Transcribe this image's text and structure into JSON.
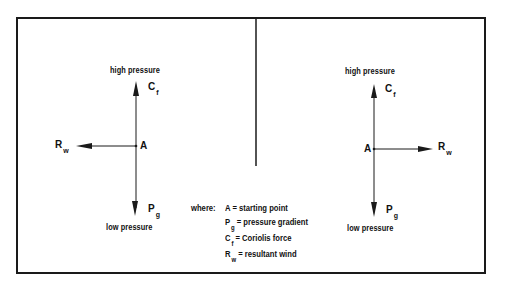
{
  "diagram": {
    "type": "force-vector-diagram",
    "left_panel": {
      "top_label": "high pressure",
      "bottom_label": "low pressure",
      "point_label": "A",
      "up_vector": {
        "symbol": "C",
        "subscript": "f"
      },
      "down_vector": {
        "symbol": "P",
        "subscript": "g"
      },
      "horizontal_vector": {
        "symbol": "R",
        "subscript": "w",
        "direction": "left"
      }
    },
    "right_panel": {
      "top_label": "high pressure",
      "bottom_label": "low pressure",
      "point_label": "A",
      "up_vector": {
        "symbol": "C",
        "subscript": "f"
      },
      "down_vector": {
        "symbol": "P",
        "subscript": "g"
      },
      "horizontal_vector": {
        "symbol": "R",
        "subscript": "w",
        "direction": "right"
      }
    },
    "legend": {
      "intro": "where:",
      "items": [
        {
          "symbol": "A",
          "subscript": "",
          "definition": "= starting point"
        },
        {
          "symbol": "P",
          "subscript": "g",
          "definition": "= pressure gradient"
        },
        {
          "symbol": "C",
          "subscript": "f",
          "definition": "= Coriolis force"
        },
        {
          "symbol": "R",
          "subscript": "w",
          "definition": "= resultant wind"
        }
      ]
    },
    "colors": {
      "ink": "#1a1a1a",
      "background": "#ffffff"
    }
  }
}
